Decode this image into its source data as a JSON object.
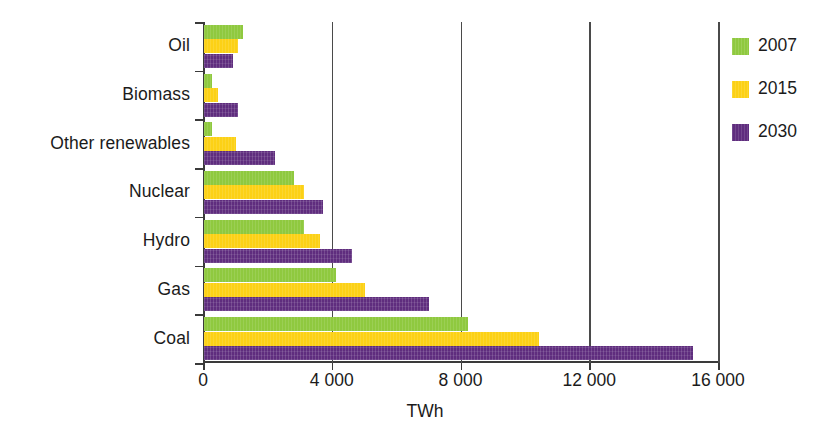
{
  "chart_data": {
    "type": "bar",
    "orientation": "horizontal",
    "title": "",
    "xlabel": "TWh",
    "ylabel": "",
    "xlim": [
      0,
      16000
    ],
    "xticks": [
      0,
      4000,
      8000,
      12000,
      16000
    ],
    "xtick_labels": [
      "0",
      "4 000",
      "8 000",
      "12 000",
      "16 000"
    ],
    "grid": "vertical-only",
    "legend_position": "right",
    "categories": [
      "Oil",
      "Biomass",
      "Other renewables",
      "Nuclear",
      "Hydro",
      "Gas",
      "Coal"
    ],
    "series": [
      {
        "name": "2007",
        "color": "#8fc93f",
        "values": [
          1200,
          250,
          250,
          2800,
          3100,
          4100,
          8200
        ]
      },
      {
        "name": "2015",
        "color": "#fcd116",
        "values": [
          1050,
          450,
          1000,
          3100,
          3600,
          5000,
          10400
        ]
      },
      {
        "name": "2030",
        "color": "#5f2d7e",
        "values": [
          900,
          1050,
          2200,
          3700,
          4600,
          7000,
          15200
        ]
      }
    ]
  },
  "axis": {
    "x_title": "TWh",
    "tick_labels": [
      "0",
      "4 000",
      "8 000",
      "12 000",
      "16 000"
    ]
  },
  "legend": {
    "entries": [
      {
        "label": "2007",
        "color": "#8fc93f"
      },
      {
        "label": "2015",
        "color": "#fcd116"
      },
      {
        "label": "2030",
        "color": "#5f2d7e"
      }
    ]
  },
  "categories": [
    {
      "label": "Oil"
    },
    {
      "label": "Biomass"
    },
    {
      "label": "Other renewables"
    },
    {
      "label": "Nuclear"
    },
    {
      "label": "Hydro"
    },
    {
      "label": "Gas"
    },
    {
      "label": "Coal"
    }
  ],
  "colors": {
    "series_2007": "#8fc93f",
    "series_2015": "#fcd116",
    "series_2030": "#5f2d7e",
    "axis": "#3a3a3a",
    "text": "#1b1b1b",
    "background": "#ffffff"
  }
}
